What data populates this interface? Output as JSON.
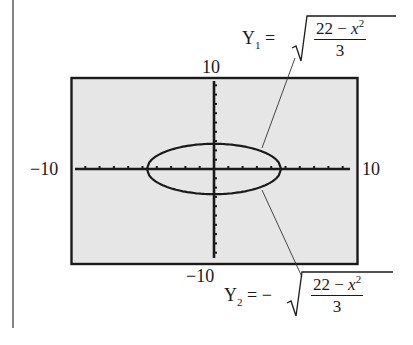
{
  "chart_data": {
    "type": "line",
    "title": "",
    "window": {
      "xmin": -10,
      "xmax": 10,
      "ymin": -10,
      "ymax": 10,
      "xscl": 1,
      "yscl": 1
    },
    "xlim": [
      -10,
      10
    ],
    "ylim": [
      -10,
      10
    ],
    "tick_labels": {
      "left": "−10",
      "right": "10",
      "top": "10",
      "bottom": "−10"
    },
    "grid": false,
    "series": [
      {
        "name": "Y1",
        "equation": "Y1 = sqrt((22 - x^2)/3)",
        "x": [
          -4.69,
          -4,
          -3,
          -2,
          -1,
          0,
          1,
          2,
          3,
          4,
          4.69
        ],
        "values": [
          0,
          1.41,
          2.08,
          2.45,
          2.65,
          2.71,
          2.65,
          2.45,
          2.08,
          1.41,
          0
        ]
      },
      {
        "name": "Y2",
        "equation": "Y2 = -sqrt((22 - x^2)/3)",
        "x": [
          -4.69,
          -4,
          -3,
          -2,
          -1,
          0,
          1,
          2,
          3,
          4,
          4.69
        ],
        "values": [
          0,
          -1.41,
          -2.08,
          -2.45,
          -2.65,
          -2.71,
          -2.65,
          -2.45,
          -2.08,
          -1.41,
          0
        ]
      }
    ],
    "annotations": [
      {
        "label": "Y1",
        "text": "Y1 = √((22 − x²)/3)",
        "points_to": "upper half of ellipse"
      },
      {
        "label": "Y2",
        "text": "Y2 = −√((22 − x²)/3)",
        "points_to": "lower half of ellipse"
      }
    ],
    "colors": {
      "screen_bg": "#e6e6e6",
      "ink": "#1a1a1a"
    }
  },
  "labels": {
    "y1_name": "Y",
    "y1_sub": "1",
    "y2_name": "Y",
    "y2_sub": "2",
    "equals": "=",
    "minus": "−",
    "numerator_a": "22 − ",
    "numerator_x": "x",
    "numerator_exp": "2",
    "denominator": "3",
    "x_min": "−10",
    "x_max": "10",
    "y_max": "10",
    "y_min": "−10"
  }
}
